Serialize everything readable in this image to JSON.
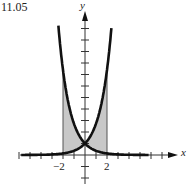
{
  "figure_label": "11.05",
  "axes": {
    "x_label": "x",
    "y_label": "y",
    "x_tick_labels": [
      "−2",
      "2"
    ]
  },
  "colors": {
    "curve": "#111111",
    "shade": "#c8c8c8",
    "axis": "#333333"
  },
  "chart_data": {
    "type": "area",
    "title": "11.05",
    "xlabel": "x",
    "ylabel": "y",
    "xlim": [
      -7,
      8
    ],
    "ylim": [
      -3,
      12.5
    ],
    "grid": false,
    "series": [
      {
        "name": "y = e^x",
        "x": [
          -7,
          -2,
          -1,
          0,
          1,
          2,
          2.5
        ],
        "values": [
          0.001,
          0.135,
          0.368,
          1,
          2.718,
          7.389,
          12.18
        ]
      },
      {
        "name": "y = e^-x",
        "x": [
          -2.5,
          -2,
          -1,
          0,
          1,
          2,
          7
        ],
        "values": [
          12.18,
          7.389,
          2.718,
          1,
          0.368,
          0.135,
          0.001
        ]
      }
    ],
    "shaded_region": {
      "x_from": -2,
      "x_to": 2,
      "between": [
        "y = e^x",
        "y = e^-x"
      ]
    },
    "annotations": [
      "x = -2",
      "x = 2"
    ],
    "x_ticks": [
      -6,
      -5,
      -4,
      -3,
      -2,
      -1,
      1,
      2,
      3,
      4,
      5,
      6,
      7
    ],
    "y_ticks": [
      -2,
      -1,
      1,
      2,
      3,
      4,
      5,
      6,
      7,
      8,
      9,
      10,
      11
    ]
  }
}
